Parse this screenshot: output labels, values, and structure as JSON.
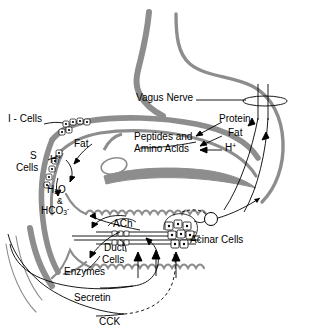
{
  "figure": {
    "type": "physiology-schematic",
    "background": "#ffffff",
    "stroke_gray": "#8d8d8d",
    "stroke_dark": "#4d4d4d",
    "text_color": "#000000"
  },
  "labels": {
    "vagus_nerve": "Vagus Nerve",
    "protein": "Protein",
    "fat_right": "Fat",
    "h_plus_right": "H+",
    "peptides_line1": "Peptides and",
    "peptides_line2": "Amino Acids",
    "i_cells": "I - Cells",
    "s_cells_line1": "S",
    "s_cells_line2": "Cells",
    "fat_left": "Fat",
    "h_plus_left": "H+",
    "water": "H2O",
    "ampersand": "&",
    "bicarbonate": "HCO3-",
    "ach": "ACh",
    "duct_cells_line1": "Duct",
    "duct_cells_line2": "Cells",
    "acinar_cells": "Acinar Cells",
    "enzymes": "Enzymes",
    "secretin": "Secretin",
    "cck": "CCK"
  },
  "structures": {
    "stomach": "stomach-outline",
    "duodenum": "duodenum-wall",
    "pancreas": "pancreas-body",
    "pancreatic_duct": "pancreatic-duct",
    "vagus_nerve_trunk": "vagus-nerve-trunk",
    "ganglion": "ganglion-cell-body",
    "endocrine_cells": "endocrine-cell-chain",
    "acinar_cluster": "acinar-cell-cluster"
  },
  "pathways": [
    {
      "name": "secretin-to-duct-cells",
      "from": "S - Cells",
      "to": "Duct Cells",
      "style": "solid"
    },
    {
      "name": "cck-to-acinar-cells",
      "from": "I - Cells",
      "to": "Acinar Cells",
      "style": "dashed"
    },
    {
      "name": "vagal-to-acinar",
      "from": "Vagus Nerve",
      "to": "Acinar Cells",
      "style": "solid"
    },
    {
      "name": "bicarbonate-secretion",
      "from": "Duct Cells",
      "to": "Duodenum",
      "style": "solid"
    },
    {
      "name": "enzyme-secretion",
      "from": "Acinar Cells",
      "to": "Duodenum",
      "style": "solid"
    }
  ]
}
